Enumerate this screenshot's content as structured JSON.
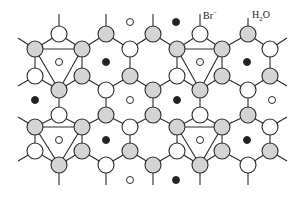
{
  "diagram": {
    "labels": {
      "bromide": {
        "text": "Br",
        "sup": "−",
        "x": 203,
        "y": 10
      },
      "water": {
        "text": "H",
        "sub": "2",
        "tail": "O",
        "x": 252,
        "y": 10
      }
    },
    "colors": {
      "line": "#2a2a2a",
      "shaded_fill": "#d4d4d4",
      "open_fill": "#ffffff",
      "dark_fill": "#222222"
    },
    "node_radius": 8,
    "small_radius": 3.5,
    "nodes": [
      {
        "x": 59,
        "y": 34,
        "t": "open"
      },
      {
        "x": 106,
        "y": 34,
        "t": "shaded"
      },
      {
        "x": 153,
        "y": 34,
        "t": "shaded"
      },
      {
        "x": 200,
        "y": 34,
        "t": "open"
      },
      {
        "x": 248,
        "y": 34,
        "t": "shaded"
      },
      {
        "x": 35,
        "y": 49,
        "t": "shaded"
      },
      {
        "x": 82,
        "y": 49,
        "t": "shaded"
      },
      {
        "x": 130,
        "y": 49,
        "t": "open"
      },
      {
        "x": 177,
        "y": 49,
        "t": "shaded"
      },
      {
        "x": 222,
        "y": 49,
        "t": "shaded"
      },
      {
        "x": 270,
        "y": 49,
        "t": "open"
      },
      {
        "x": 35,
        "y": 76,
        "t": "open"
      },
      {
        "x": 82,
        "y": 76,
        "t": "shaded"
      },
      {
        "x": 130,
        "y": 76,
        "t": "shaded"
      },
      {
        "x": 177,
        "y": 76,
        "t": "open"
      },
      {
        "x": 222,
        "y": 76,
        "t": "shaded"
      },
      {
        "x": 270,
        "y": 76,
        "t": "shaded"
      },
      {
        "x": 59,
        "y": 90,
        "t": "shaded"
      },
      {
        "x": 106,
        "y": 90,
        "t": "open"
      },
      {
        "x": 153,
        "y": 90,
        "t": "shaded"
      },
      {
        "x": 200,
        "y": 90,
        "t": "shaded"
      },
      {
        "x": 248,
        "y": 90,
        "t": "open"
      },
      {
        "x": 59,
        "y": 115,
        "t": "open"
      },
      {
        "x": 106,
        "y": 115,
        "t": "shaded"
      },
      {
        "x": 153,
        "y": 115,
        "t": "shaded"
      },
      {
        "x": 200,
        "y": 115,
        "t": "open"
      },
      {
        "x": 248,
        "y": 115,
        "t": "shaded"
      },
      {
        "x": 35,
        "y": 127,
        "t": "shaded"
      },
      {
        "x": 82,
        "y": 127,
        "t": "shaded"
      },
      {
        "x": 130,
        "y": 127,
        "t": "open"
      },
      {
        "x": 177,
        "y": 127,
        "t": "shaded"
      },
      {
        "x": 222,
        "y": 127,
        "t": "shaded"
      },
      {
        "x": 270,
        "y": 127,
        "t": "open"
      },
      {
        "x": 35,
        "y": 151,
        "t": "open"
      },
      {
        "x": 82,
        "y": 151,
        "t": "shaded"
      },
      {
        "x": 130,
        "y": 151,
        "t": "shaded"
      },
      {
        "x": 177,
        "y": 151,
        "t": "open"
      },
      {
        "x": 222,
        "y": 151,
        "t": "shaded"
      },
      {
        "x": 270,
        "y": 151,
        "t": "shaded"
      },
      {
        "x": 59,
        "y": 165,
        "t": "shaded"
      },
      {
        "x": 106,
        "y": 165,
        "t": "open"
      },
      {
        "x": 153,
        "y": 165,
        "t": "shaded"
      },
      {
        "x": 200,
        "y": 165,
        "t": "shaded"
      },
      {
        "x": 248,
        "y": 165,
        "t": "open"
      }
    ],
    "small": [
      {
        "x": 130,
        "y": 22,
        "t": "open"
      },
      {
        "x": 176,
        "y": 22,
        "t": "dark"
      },
      {
        "x": 59,
        "y": 62,
        "t": "open"
      },
      {
        "x": 106,
        "y": 62,
        "t": "dark"
      },
      {
        "x": 200,
        "y": 62,
        "t": "open"
      },
      {
        "x": 247,
        "y": 62,
        "t": "dark"
      },
      {
        "x": 35,
        "y": 100,
        "t": "dark"
      },
      {
        "x": 130,
        "y": 100,
        "t": "open"
      },
      {
        "x": 177,
        "y": 100,
        "t": "dark"
      },
      {
        "x": 272,
        "y": 100,
        "t": "open"
      },
      {
        "x": 59,
        "y": 140,
        "t": "open"
      },
      {
        "x": 106,
        "y": 140,
        "t": "dark"
      },
      {
        "x": 200,
        "y": 140,
        "t": "open"
      },
      {
        "x": 247,
        "y": 140,
        "t": "dark"
      },
      {
        "x": 130,
        "y": 180,
        "t": "open"
      },
      {
        "x": 176,
        "y": 180,
        "t": "dark"
      }
    ],
    "edges": [
      [
        35,
        49,
        59,
        34
      ],
      [
        59,
        34,
        82,
        49
      ],
      [
        82,
        49,
        106,
        34
      ],
      [
        106,
        34,
        130,
        49
      ],
      [
        130,
        49,
        153,
        34
      ],
      [
        153,
        34,
        177,
        49
      ],
      [
        177,
        49,
        200,
        34
      ],
      [
        200,
        34,
        222,
        49
      ],
      [
        222,
        49,
        248,
        34
      ],
      [
        248,
        34,
        270,
        49
      ],
      [
        35,
        49,
        35,
        76
      ],
      [
        82,
        49,
        82,
        76
      ],
      [
        130,
        49,
        130,
        76
      ],
      [
        177,
        49,
        177,
        76
      ],
      [
        222,
        49,
        222,
        76
      ],
      [
        270,
        49,
        270,
        76
      ],
      [
        35,
        76,
        59,
        90
      ],
      [
        59,
        90,
        82,
        76
      ],
      [
        82,
        76,
        106,
        90
      ],
      [
        106,
        90,
        130,
        76
      ],
      [
        130,
        76,
        153,
        90
      ],
      [
        153,
        90,
        177,
        76
      ],
      [
        177,
        76,
        200,
        90
      ],
      [
        200,
        90,
        222,
        76
      ],
      [
        222,
        76,
        248,
        90
      ],
      [
        248,
        90,
        270,
        76
      ],
      [
        59,
        90,
        59,
        115
      ],
      [
        106,
        90,
        106,
        115
      ],
      [
        153,
        90,
        153,
        115
      ],
      [
        200,
        90,
        200,
        115
      ],
      [
        248,
        90,
        248,
        115
      ],
      [
        35,
        127,
        59,
        115
      ],
      [
        59,
        115,
        82,
        127
      ],
      [
        82,
        127,
        106,
        115
      ],
      [
        106,
        115,
        130,
        127
      ],
      [
        130,
        127,
        153,
        115
      ],
      [
        153,
        115,
        177,
        127
      ],
      [
        177,
        127,
        200,
        115
      ],
      [
        200,
        115,
        222,
        127
      ],
      [
        222,
        127,
        248,
        115
      ],
      [
        248,
        115,
        270,
        127
      ],
      [
        35,
        127,
        35,
        151
      ],
      [
        82,
        127,
        82,
        151
      ],
      [
        130,
        127,
        130,
        151
      ],
      [
        177,
        127,
        177,
        151
      ],
      [
        222,
        127,
        222,
        151
      ],
      [
        270,
        127,
        270,
        151
      ],
      [
        35,
        151,
        59,
        165
      ],
      [
        59,
        165,
        82,
        151
      ],
      [
        82,
        151,
        106,
        165
      ],
      [
        106,
        165,
        130,
        151
      ],
      [
        130,
        151,
        153,
        165
      ],
      [
        153,
        165,
        177,
        151
      ],
      [
        177,
        151,
        200,
        165
      ],
      [
        200,
        165,
        222,
        151
      ],
      [
        222,
        151,
        248,
        165
      ],
      [
        248,
        165,
        270,
        151
      ],
      [
        59,
        34,
        59,
        14
      ],
      [
        106,
        34,
        106,
        14
      ],
      [
        153,
        34,
        153,
        14
      ],
      [
        200,
        34,
        200,
        14
      ],
      [
        248,
        34,
        248,
        18
      ],
      [
        59,
        165,
        59,
        185
      ],
      [
        106,
        165,
        106,
        185
      ],
      [
        153,
        165,
        153,
        185
      ],
      [
        200,
        165,
        200,
        185
      ],
      [
        248,
        165,
        248,
        185
      ],
      [
        35,
        49,
        18,
        38
      ],
      [
        270,
        49,
        287,
        38
      ],
      [
        35,
        76,
        18,
        86
      ],
      [
        270,
        76,
        287,
        86
      ],
      [
        35,
        127,
        18,
        117
      ],
      [
        270,
        127,
        287,
        117
      ],
      [
        35,
        151,
        18,
        161
      ],
      [
        270,
        151,
        287,
        161
      ],
      [
        35,
        49,
        82,
        49
      ],
      [
        35,
        49,
        59,
        90
      ],
      [
        82,
        49,
        59,
        90
      ],
      [
        177,
        49,
        222,
        49
      ],
      [
        177,
        49,
        200,
        90
      ],
      [
        222,
        49,
        200,
        90
      ],
      [
        35,
        127,
        82,
        127
      ],
      [
        35,
        127,
        59,
        165
      ],
      [
        82,
        127,
        59,
        165
      ],
      [
        177,
        127,
        222,
        127
      ],
      [
        177,
        127,
        200,
        165
      ],
      [
        222,
        127,
        200,
        165
      ]
    ]
  }
}
